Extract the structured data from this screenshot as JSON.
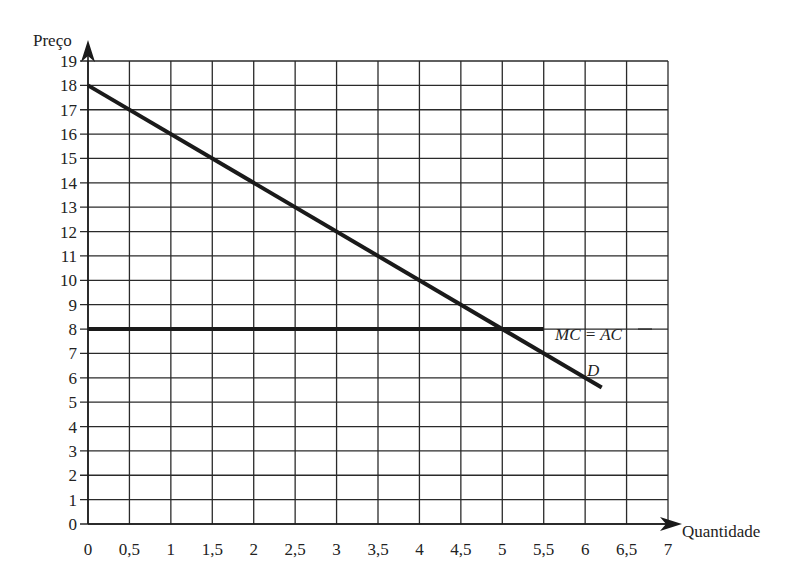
{
  "chart_data": {
    "type": "line",
    "title": "",
    "xlabel": "Quantidade",
    "ylabel": "Preço",
    "xlim": [
      0,
      7
    ],
    "ylim": [
      0,
      19
    ],
    "grid": true,
    "x_ticks": [
      "0",
      "0,5",
      "1",
      "1,5",
      "2",
      "2,5",
      "3",
      "3,5",
      "4",
      "4,5",
      "5",
      "5,5",
      "6",
      "6,5",
      "7"
    ],
    "y_ticks": [
      "0",
      "1",
      "2",
      "3",
      "4",
      "5",
      "6",
      "7",
      "8",
      "9",
      "10",
      "11",
      "12",
      "13",
      "14",
      "15",
      "16",
      "17",
      "18",
      "19"
    ],
    "series": [
      {
        "name": "D",
        "label": "D",
        "points": [
          [
            0,
            18
          ],
          [
            6.2,
            5.6
          ]
        ],
        "description": "Demand: P = 18 - 2Q"
      },
      {
        "name": "MC = AC",
        "label": "MC = AC",
        "points": [
          [
            0,
            8
          ],
          [
            5.5,
            8
          ]
        ],
        "description": "Constant marginal and average cost at 8"
      }
    ],
    "annotations": [
      {
        "text": "MC = AC",
        "x": 5.55,
        "y": 8
      },
      {
        "text": "D",
        "x": 5.95,
        "y": 6.3
      }
    ]
  },
  "labels": {
    "x_axis": "Quantidade",
    "y_axis": "Preço",
    "mc_ac": "MC = AC",
    "demand": "D"
  }
}
